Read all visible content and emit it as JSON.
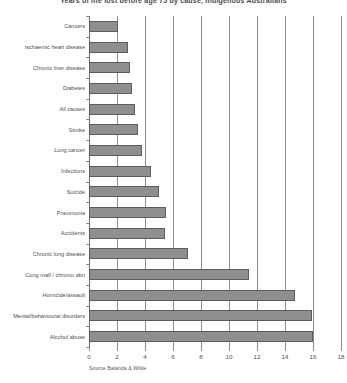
{
  "chart_data": {
    "type": "bar",
    "orientation": "horizontal",
    "title": "Years of life lost before age 75 by cause, Indigenous Australians",
    "subtitle": "",
    "xlabel": "",
    "ylabel": "",
    "xlim": [
      0,
      18
    ],
    "ylim": null,
    "grid": true,
    "legend": null,
    "legend_position": "none",
    "source": "Source Balanda & Wilde",
    "xticks": [
      0,
      2,
      4,
      6,
      8,
      10,
      12,
      14,
      16,
      18
    ],
    "xtick_labels": [
      "0",
      "2",
      "4",
      "6",
      "8",
      "10",
      "12",
      "14",
      "16",
      "18"
    ],
    "categories": [
      "Cancers",
      "Ischaemic heart disease",
      "Chronic liver disease",
      "Diabetes",
      "All causes",
      "Stroke",
      "Lung cancer",
      "Infections",
      "Suicide",
      "Pneumonia",
      "Accidents",
      "Chronic lung disease",
      "Cong malf / chromo abn",
      "Homicide/assault",
      "Mental/behavioural disorders",
      "Alcohol abuse"
    ],
    "values": [
      2.1,
      2.8,
      2.9,
      3.1,
      3.3,
      3.5,
      3.8,
      4.4,
      5.0,
      5.5,
      5.4,
      7.1,
      11.4,
      14.7,
      15.9,
      16.0
    ],
    "bar_color": "#8f8f8f",
    "bar_edge_color": "#5d5d5d",
    "grid_color": "#8e8e8e",
    "text_color": "#4f4f4f",
    "background_color": "#ffffff"
  }
}
